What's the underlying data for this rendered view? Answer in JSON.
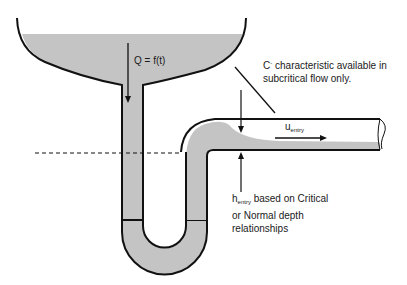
{
  "diagram": {
    "type": "hydraulic-schematic",
    "colors": {
      "water": "#c4c4c4",
      "outline": "#111111",
      "background": "#ffffff"
    },
    "labels": {
      "flow": "Q = f(t)",
      "characteristic_symbol": "C",
      "characteristic_superscript": "-",
      "characteristic_line1": " characteristic available in",
      "characteristic_line2": "subcritical flow only.",
      "velocity_symbol": "u",
      "velocity_subscript": "entry",
      "depth_symbol": "h",
      "depth_subscript": "entry",
      "depth_line1": " based on Critical",
      "depth_line2": "or Normal depth",
      "depth_line3": "relationships"
    },
    "components": [
      "tank",
      "vertical-downpipe",
      "u-bend-trap",
      "elbow",
      "horizontal-outlet-pipe",
      "datum-dashed-line"
    ]
  }
}
